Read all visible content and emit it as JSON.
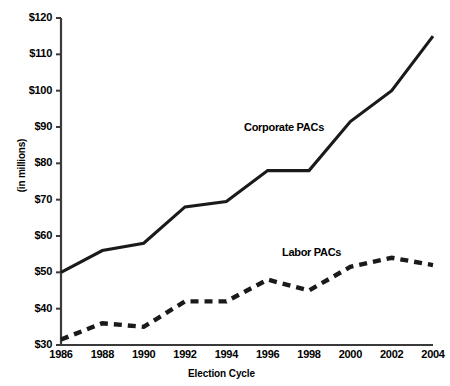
{
  "chart_data": {
    "type": "line",
    "title": "",
    "xlabel": "Election Cycle",
    "ylabel": "(in millions)",
    "x": [
      1986,
      1988,
      1990,
      1992,
      1994,
      1996,
      1998,
      2000,
      2002,
      2004
    ],
    "xtick_labels": [
      "1986",
      "1988",
      "1990",
      "1992",
      "1994",
      "1996",
      "1998",
      "2000",
      "2002",
      "2004"
    ],
    "ytick_labels": [
      "$30",
      "$40",
      "$50",
      "$60",
      "$70",
      "$80",
      "$90",
      "$100",
      "$110",
      "$120"
    ],
    "ytick_values": [
      30,
      40,
      50,
      60,
      70,
      80,
      90,
      100,
      110,
      120
    ],
    "xlim": [
      1986,
      2004
    ],
    "ylim": [
      30,
      120
    ],
    "grid": false,
    "legend_position": "inline-annotations",
    "series": [
      {
        "name": "Corporate PACs",
        "style": "solid",
        "color": "#1a1a1a",
        "values": [
          50,
          56,
          58,
          68,
          69.5,
          78,
          78,
          91.5,
          100,
          115
        ]
      },
      {
        "name": "Labor PACs",
        "style": "dashed",
        "color": "#1a1a1a",
        "values": [
          31.5,
          36,
          35,
          42,
          42,
          48,
          45,
          51.5,
          54,
          52
        ]
      }
    ],
    "annotations": [
      {
        "text": "Corporate PACs",
        "series": "Corporate PACs"
      },
      {
        "text": "Labor PACs",
        "series": "Labor PACs"
      }
    ]
  },
  "axis": {
    "line_color": "#3a3a3a"
  }
}
